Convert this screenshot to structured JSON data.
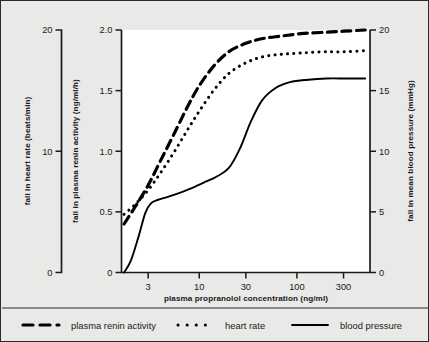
{
  "figure": {
    "background_color": "#e9e9e7",
    "plot_background_color": "#ffffff",
    "ink_color": "#1a1a1a"
  },
  "chart_data": {
    "type": "line",
    "title": "",
    "subtitle": "",
    "xlabel": "plasma propranolol concentration (ng/ml)",
    "x_scale": "log",
    "xlim": [
      1.6,
      560
    ],
    "x_ticks": [
      3,
      10,
      30,
      100,
      300
    ],
    "x_tick_labels": [
      "3",
      "10",
      "30",
      "100",
      "300"
    ],
    "grid": false,
    "legend_position": "below-plot",
    "axes": [
      {
        "id": "left-outer",
        "name": "heart-rate-axis",
        "label": "fall in heart rate (beats/min)",
        "ticks": [
          0,
          10,
          20
        ],
        "tick_labels": [
          "0",
          "10",
          "20"
        ],
        "lim": [
          0,
          20
        ],
        "position": "far-left"
      },
      {
        "id": "left-inner",
        "name": "plasma-renin-activity-axis",
        "label": "fall in plasma renin activity (ng/ml/h)",
        "ticks": [
          0,
          0.5,
          1.0,
          1.5,
          2.0
        ],
        "tick_labels": [
          "0",
          "0.5",
          "1.0",
          "1.5",
          "2.0"
        ],
        "lim": [
          0,
          2.0
        ],
        "position": "inner-left"
      },
      {
        "id": "right",
        "name": "mean-blood-pressure-axis",
        "label": "fall in mean blood pressure (mmHg)",
        "ticks": [
          0,
          5,
          10,
          15,
          20
        ],
        "tick_labels": [
          "0",
          "5",
          "10",
          "15",
          "20"
        ],
        "lim": [
          0,
          20
        ],
        "position": "right"
      }
    ],
    "series": [
      {
        "name": "plasma renin activity",
        "style": "dashed",
        "axis": "left-inner",
        "units": "ng/ml/h",
        "x": [
          1.7,
          2.2,
          3.0,
          4.0,
          5.5,
          7.5,
          10,
          14,
          20,
          30,
          45,
          70,
          110,
          180,
          300,
          500
        ],
        "y": [
          0.4,
          0.54,
          0.72,
          0.92,
          1.14,
          1.36,
          1.54,
          1.7,
          1.82,
          1.89,
          1.93,
          1.95,
          1.97,
          1.98,
          1.99,
          2.0
        ]
      },
      {
        "name": "heart rate",
        "style": "dotted",
        "axis": "left-inner",
        "units": "ng/ml/h",
        "x": [
          1.7,
          2.2,
          3.0,
          4.0,
          5.5,
          7.5,
          10,
          14,
          20,
          30,
          45,
          70,
          110,
          180,
          300,
          500
        ],
        "y": [
          0.48,
          0.56,
          0.68,
          0.82,
          0.99,
          1.17,
          1.33,
          1.5,
          1.64,
          1.73,
          1.78,
          1.8,
          1.81,
          1.82,
          1.82,
          1.83
        ]
      },
      {
        "name": "blood pressure",
        "style": "solid",
        "axis": "left-inner",
        "units": "ng/ml/h",
        "x": [
          1.7,
          2.0,
          2.4,
          2.8,
          3.2,
          3.8,
          4.6,
          6.0,
          8.0,
          11,
          15,
          20,
          26,
          34,
          44,
          60,
          85,
          130,
          200,
          320,
          500
        ],
        "y": [
          0.0,
          0.1,
          0.3,
          0.49,
          0.57,
          0.6,
          0.62,
          0.65,
          0.69,
          0.74,
          0.79,
          0.86,
          1.02,
          1.25,
          1.42,
          1.52,
          1.57,
          1.59,
          1.6,
          1.6,
          1.6
        ]
      }
    ]
  },
  "legend": {
    "items": [
      {
        "label": "plasma renin activity",
        "style": "dashed"
      },
      {
        "label": "heart rate",
        "style": "dotted"
      },
      {
        "label": "blood pressure",
        "style": "solid"
      }
    ]
  }
}
